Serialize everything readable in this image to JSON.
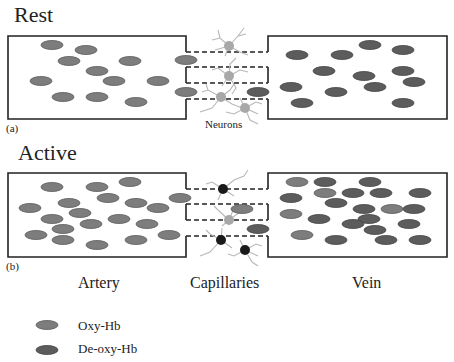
{
  "panels": {
    "rest": {
      "title": "Rest",
      "tag": "(a)",
      "neurons_label": "Neurons"
    },
    "active": {
      "title": "Active",
      "tag": "(b)"
    }
  },
  "sections": {
    "artery": "Artery",
    "capillaries": "Capillaries",
    "vein": "Vein"
  },
  "legend": [
    {
      "label": "Oxy-Hb",
      "color": "#7d7d7d"
    },
    {
      "label": "De-oxy-Hb",
      "color": "#5c5c5c"
    }
  ],
  "colors": {
    "oxy_hb": "#7d7d7d",
    "deoxy_hb": "#5c5c5c",
    "neuron_rest": "#a8a8a8",
    "neuron_active": "#1a1a1a",
    "dendrite": "#b8b8b8"
  }
}
